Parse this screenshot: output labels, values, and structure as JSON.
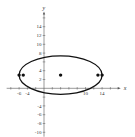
{
  "chart_data": {
    "type": "scatter",
    "title": "",
    "xlabel": "x",
    "ylabel": "y",
    "xlim": [
      -9,
      18
    ],
    "ylim": [
      -11,
      17
    ],
    "grid": false,
    "x_tick_labels": [
      "-6",
      "-4",
      "10",
      "14"
    ],
    "x_tick_label_values": [
      -6,
      -4,
      10,
      14
    ],
    "y_tick_labels": [
      "14",
      "12",
      "10",
      "8",
      "4",
      "2",
      "-4",
      "-6",
      "-8",
      "-10"
    ],
    "y_tick_label_values": [
      14,
      12,
      10,
      8,
      4,
      2,
      -4,
      -6,
      -8,
      -10
    ],
    "curve": {
      "shape": "ellipse",
      "center": [
        4,
        3
      ],
      "semi_major_horizontal": 10,
      "semi_minor_vertical": 4.36
    },
    "points": [
      {
        "x": -6,
        "y": 3,
        "label": "vertex"
      },
      {
        "x": -5,
        "y": 3,
        "label": "focus"
      },
      {
        "x": 4,
        "y": 3,
        "label": "center"
      },
      {
        "x": 13,
        "y": 3,
        "label": "focus"
      },
      {
        "x": 14,
        "y": 3,
        "label": "vertex"
      }
    ]
  },
  "colors": {
    "axis": "#555555",
    "curve": "#111111",
    "point": "#111111"
  }
}
